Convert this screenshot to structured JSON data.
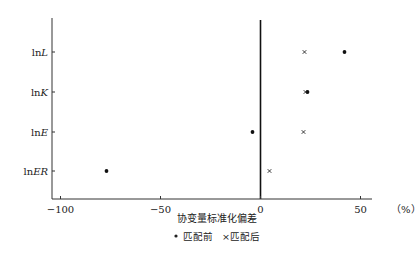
{
  "chart_data": {
    "type": "scatter",
    "title": "",
    "xlabel": "协变量标准化偏差",
    "xunit": "（%）",
    "ylabel": "",
    "xlim": [
      -105,
      55
    ],
    "xticks": [
      -100,
      -50,
      0,
      50
    ],
    "xtick_labels": [
      "−100",
      "−50",
      "0",
      "50"
    ],
    "categories": [
      "lnL",
      "lnK",
      "lnE",
      "lnER"
    ],
    "category_labels": [
      {
        "prefix": "ln",
        "italic": "L"
      },
      {
        "prefix": "ln",
        "italic": "K"
      },
      {
        "prefix": "ln",
        "italic": "E"
      },
      {
        "prefix": "ln",
        "italic": "ER"
      }
    ],
    "series": [
      {
        "name": "匹配前",
        "marker": "dot",
        "values": [
          42,
          23.5,
          -4,
          -77
        ]
      },
      {
        "name": "匹配后",
        "marker": "x",
        "values": [
          22,
          22.5,
          21.5,
          4.5
        ]
      }
    ],
    "reference_line": {
      "x": 0
    },
    "grid": false,
    "legend_position": "bottom-center",
    "legend": [
      {
        "symbol": "•",
        "label": "匹配前"
      },
      {
        "symbol": "×",
        "label": "匹配后"
      }
    ]
  }
}
